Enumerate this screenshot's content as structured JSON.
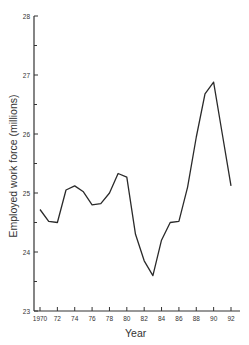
{
  "chart_data": {
    "type": "line",
    "title": "",
    "xlabel": "Year",
    "ylabel": "Employed work force (millions)",
    "x": [
      1970,
      1971,
      1972,
      1973,
      1974,
      1975,
      1976,
      1977,
      1978,
      1979,
      1980,
      1981,
      1982,
      1983,
      1984,
      1985,
      1986,
      1987,
      1988,
      1989,
      1990,
      1991,
      1992
    ],
    "series": [
      {
        "name": "Employed work force",
        "values": [
          24.72,
          24.52,
          24.5,
          25.05,
          25.12,
          25.02,
          24.8,
          24.82,
          25.0,
          25.33,
          25.27,
          24.3,
          23.85,
          23.6,
          24.2,
          24.5,
          24.52,
          25.1,
          25.95,
          26.68,
          26.88,
          26.0,
          25.12
        ]
      }
    ],
    "xticks": [
      "1970",
      "72",
      "74",
      "76",
      "78",
      "80",
      "82",
      "84",
      "86",
      "88",
      "90",
      "92"
    ],
    "yticks": [
      "23",
      "24",
      "25",
      "26",
      "27",
      "28"
    ],
    "xlim": [
      1970,
      1992
    ],
    "ylim": [
      23,
      28
    ],
    "grid": false,
    "legend": "none"
  },
  "colors": {
    "line": "#2a2a2a",
    "axis": "#333333"
  }
}
